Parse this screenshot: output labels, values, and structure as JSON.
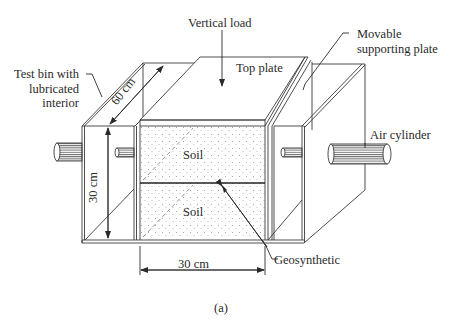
{
  "figure": {
    "caption": "(a)"
  },
  "labels": {
    "vertical_load": "Vertical load",
    "movable_plate_line1": "Movable",
    "movable_plate_line2": "supporting plate",
    "test_bin_line1": "Test bin with",
    "test_bin_line2": "lubricated",
    "test_bin_line3": "interior",
    "top_plate": "Top plate",
    "air_cylinder": "Air cylinder",
    "soil_upper": "Soil",
    "soil_lower": "Soil",
    "geosynthetic": "Geosynthetic"
  },
  "dimensions": {
    "depth": "60 cm",
    "height": "30 cm",
    "width": "30 cm"
  },
  "colors": {
    "line": "#3a3a3a",
    "soil_dot": "#9a9a9a",
    "background": "#ffffff"
  }
}
